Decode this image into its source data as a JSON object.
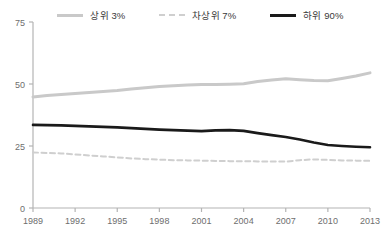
{
  "chart_data": {
    "type": "line",
    "title": "",
    "subtitle": "",
    "xlabel": "",
    "ylabel": "",
    "xlim": [
      1989,
      2013
    ],
    "ylim": [
      0,
      75
    ],
    "yticks": [
      0,
      25,
      50,
      75
    ],
    "ytick_labels": [
      "0",
      "25",
      "50",
      "75"
    ],
    "xticks": [
      1989,
      1992,
      1995,
      1998,
      2001,
      2004,
      2007,
      2010,
      2013
    ],
    "xtick_labels": [
      "1989",
      "1992",
      "1995",
      "1998",
      "2001",
      "2004",
      "2007",
      "2010",
      "2013"
    ],
    "grid": false,
    "legend_position": "top",
    "x": [
      1989,
      1990,
      1991,
      1992,
      1993,
      1994,
      1995,
      1996,
      1997,
      1998,
      1999,
      2000,
      2001,
      2002,
      2003,
      2004,
      2005,
      2006,
      2007,
      2008,
      2009,
      2010,
      2011,
      2012,
      2013
    ],
    "series": [
      {
        "name": "상위 3%",
        "style": "solid",
        "color": "#c9c9c9",
        "width": 3,
        "values": [
          44.8,
          45.4,
          45.8,
          46.2,
          46.6,
          47.0,
          47.4,
          48.0,
          48.5,
          49.0,
          49.3,
          49.6,
          49.8,
          49.8,
          49.9,
          50.1,
          51.0,
          51.6,
          52.1,
          51.7,
          51.4,
          51.3,
          52.2,
          53.2,
          54.5
        ]
      },
      {
        "name": "차상위 7%",
        "style": "dashed",
        "color": "#cfcfcf",
        "width": 2,
        "values": [
          22.4,
          22.2,
          22.0,
          21.6,
          21.2,
          20.8,
          20.4,
          20.0,
          19.7,
          19.5,
          19.3,
          19.2,
          19.1,
          19.0,
          18.9,
          18.9,
          18.8,
          18.7,
          18.7,
          19.3,
          19.6,
          19.4,
          19.2,
          19.1,
          19.0
        ]
      },
      {
        "name": "하위 90%",
        "style": "solid",
        "color": "#1a1a1a",
        "width": 2.6,
        "values": [
          33.5,
          33.4,
          33.3,
          33.1,
          32.9,
          32.7,
          32.5,
          32.2,
          31.9,
          31.6,
          31.4,
          31.2,
          31.0,
          31.3,
          31.4,
          31.1,
          30.2,
          29.4,
          28.6,
          27.6,
          26.4,
          25.4,
          25.0,
          24.7,
          24.5
        ]
      }
    ]
  },
  "legend": {
    "items": [
      {
        "label": "상위 3%",
        "color": "#c9c9c9",
        "style": "solid"
      },
      {
        "label": "차상위 7%",
        "color": "#cfcfcf",
        "style": "dashed"
      },
      {
        "label": "하위 90%",
        "color": "#1a1a1a",
        "style": "solid"
      }
    ]
  },
  "axis": {
    "color": "#b4b4b4",
    "label_color": "#6e6e6e"
  }
}
